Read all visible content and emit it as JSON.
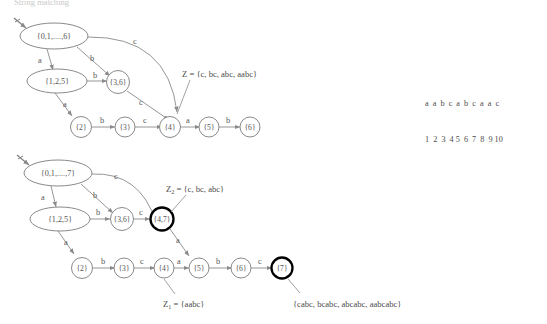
{
  "title": {
    "text": "String matching"
  },
  "input_string": {
    "symbols": "a  a  b  c  a  b  c  a  a  c",
    "indices": "1  2  3  4 5  6  7  8  9 10"
  },
  "colors": {
    "node_stroke": "#8a8a8a",
    "accept_stroke": "#000000",
    "edge_stroke": "#8a8a8a",
    "text": "#4d4d4d",
    "title": "#c9c9c9"
  },
  "diagram_top": {
    "name": "nfa-subset-construction-6",
    "nodes": [
      {
        "id": "s0",
        "label": "{0,1,....,6}",
        "shape": "ellipse",
        "accepting": false
      },
      {
        "id": "s125",
        "label": "{1,2,5}",
        "shape": "ellipse",
        "accepting": false
      },
      {
        "id": "s36",
        "label": "{3,6}",
        "shape": "circle",
        "accepting": false
      },
      {
        "id": "s4",
        "label": "{4}",
        "shape": "circle",
        "accepting": false
      },
      {
        "id": "s2",
        "label": "{2}",
        "shape": "circle",
        "accepting": false
      },
      {
        "id": "s3",
        "label": "{3}",
        "shape": "circle",
        "accepting": false
      },
      {
        "id": "s5",
        "label": "{5}",
        "shape": "circle",
        "accepting": false
      },
      {
        "id": "s6",
        "label": "{6}",
        "shape": "circle",
        "accepting": false
      }
    ],
    "edges": [
      {
        "from": "s0",
        "to": "s125",
        "label": "a"
      },
      {
        "from": "s0",
        "to": "s36",
        "label": "b"
      },
      {
        "from": "s0",
        "to": "s4",
        "label": "c"
      },
      {
        "from": "s125",
        "to": "s36",
        "label": "b"
      },
      {
        "from": "s125",
        "to": "s2",
        "label": "a"
      },
      {
        "from": "s36",
        "to": "s4",
        "label": "c"
      },
      {
        "from": "s2",
        "to": "s3",
        "label": "b"
      },
      {
        "from": "s3",
        "to": "s4",
        "label": "c"
      },
      {
        "from": "s4",
        "to": "s5",
        "label": "a"
      },
      {
        "from": "s5",
        "to": "s6",
        "label": "b"
      }
    ],
    "annotations": [
      {
        "id": "z-label",
        "text": "Z = {c, bc, abc, aabc}",
        "target": "s4"
      }
    ]
  },
  "diagram_bottom": {
    "name": "nfa-subset-construction-7",
    "nodes": [
      {
        "id": "t0",
        "label": "{0,1,....,7}",
        "shape": "ellipse",
        "accepting": false
      },
      {
        "id": "t125",
        "label": "{1,2,5}",
        "shape": "ellipse",
        "accepting": false
      },
      {
        "id": "t36",
        "label": "{3,6}",
        "shape": "circle",
        "accepting": false
      },
      {
        "id": "t47",
        "label": "{4,7}",
        "shape": "circle",
        "accepting": true
      },
      {
        "id": "t2",
        "label": "{2}",
        "shape": "circle",
        "accepting": false
      },
      {
        "id": "t3",
        "label": "{3}",
        "shape": "circle",
        "accepting": false
      },
      {
        "id": "t4",
        "label": "{4}",
        "shape": "circle",
        "accepting": false
      },
      {
        "id": "t5",
        "label": "{5}",
        "shape": "circle",
        "accepting": false
      },
      {
        "id": "t6",
        "label": "{6}",
        "shape": "circle",
        "accepting": false
      },
      {
        "id": "t7",
        "label": "{7}",
        "shape": "circle",
        "accepting": true
      }
    ],
    "edges": [
      {
        "from": "t0",
        "to": "t125",
        "label": "a"
      },
      {
        "from": "t0",
        "to": "t36",
        "label": "b"
      },
      {
        "from": "t0",
        "to": "t47",
        "label": "c"
      },
      {
        "from": "t125",
        "to": "t36",
        "label": "b"
      },
      {
        "from": "t125",
        "to": "t2",
        "label": "a"
      },
      {
        "from": "t36",
        "to": "t47",
        "label": "c"
      },
      {
        "from": "t47",
        "to": "t5",
        "label": "a"
      },
      {
        "from": "t2",
        "to": "t3",
        "label": "b"
      },
      {
        "from": "t3",
        "to": "t4",
        "label": "c"
      },
      {
        "from": "t4",
        "to": "t5",
        "label": "a"
      },
      {
        "from": "t5",
        "to": "t6",
        "label": "b"
      },
      {
        "from": "t6",
        "to": "t7",
        "label": "c"
      }
    ],
    "annotations": [
      {
        "id": "z2-label",
        "base": "Z",
        "sub": "2",
        "text": " = {c, bc, abc}",
        "target": "t47"
      },
      {
        "id": "z1-label",
        "base": "Z",
        "sub": "1",
        "text": " = {aabc}",
        "target": "t4"
      },
      {
        "id": "accept-set-label",
        "text": "{cabc, bcabc, abcabc, aabcabc}",
        "target": "t7"
      }
    ]
  }
}
